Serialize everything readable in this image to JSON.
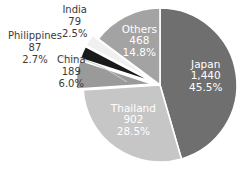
{
  "chart_data": {
    "type": "pie",
    "title": "",
    "subtitle": "",
    "xlabel": "",
    "ylabel": "",
    "legend_position": "none",
    "grid": false,
    "total": 3165,
    "categories": [
      "Japan",
      "Thailand",
      "China",
      "Philippines",
      "India",
      "Others"
    ],
    "values": [
      1440,
      902,
      189,
      87,
      79,
      468
    ],
    "percents": [
      45.5,
      28.5,
      6.0,
      2.7,
      2.5,
      14.8
    ],
    "value_labels": [
      "1,440",
      "902",
      "189",
      "87",
      "79",
      "468"
    ],
    "percent_labels": [
      "45.5%",
      "28.5%",
      "6.0%",
      "2.7%",
      "2.5%",
      "14.8%"
    ],
    "colors": [
      "#6f6f6f",
      "#c6c6c6",
      "#9a9a9a",
      "#1a1a1a",
      "#f0f0f0",
      "#a3a3a3"
    ],
    "label_placement": [
      "inside",
      "inside",
      "outside",
      "outside",
      "outside",
      "inside"
    ],
    "slices": [
      {
        "name": "Japan",
        "value": 1440,
        "value_label": "1,440",
        "percent": 45.5,
        "percent_label": "45.5%",
        "color": "#6f6f6f",
        "label_color": "#ffffff",
        "exploded": false,
        "placement": "inside"
      },
      {
        "name": "Thailand",
        "value": 902,
        "value_label": "902",
        "percent": 28.5,
        "percent_label": "28.5%",
        "color": "#c6c6c6",
        "label_color": "#ffffff",
        "exploded": false,
        "placement": "inside"
      },
      {
        "name": "China",
        "value": 189,
        "value_label": "189",
        "percent": 6.0,
        "percent_label": "6.0%",
        "color": "#9a9a9a",
        "label_color": "#3a3a3a",
        "exploded": true,
        "placement": "outside"
      },
      {
        "name": "Philippines",
        "value": 87,
        "value_label": "87",
        "percent": 2.7,
        "percent_label": "2.7%",
        "color": "#1a1a1a",
        "label_color": "#3a3a3a",
        "exploded": true,
        "placement": "outside"
      },
      {
        "name": "India",
        "value": 79,
        "value_label": "79",
        "percent": 2.5,
        "percent_label": "2.5%",
        "color": "#f0f0f0",
        "label_color": "#3a3a3a",
        "exploded": true,
        "placement": "outside"
      },
      {
        "name": "Others",
        "value": 468,
        "value_label": "468",
        "percent": 14.8,
        "percent_label": "14.8%",
        "color": "#a3a3a3",
        "label_color": "#ffffff",
        "exploded": false,
        "placement": "inside"
      }
    ]
  },
  "figure": {
    "background": "#ffffff",
    "separator_color": "#ffffff",
    "leader_line_color": "#cfcfcf"
  }
}
